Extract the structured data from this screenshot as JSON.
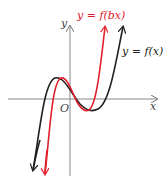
{
  "diagram": {
    "title": "",
    "axes": {
      "x_label": "x",
      "y_label": "y",
      "origin_label": "O"
    },
    "curves": [
      {
        "name": "original",
        "label": "y = f(x)",
        "color": "#231f20"
      },
      {
        "name": "stretched",
        "label": "y = f(bx)",
        "color": "#e0202c"
      }
    ],
    "colors": {
      "axis": "#888888",
      "black_curve": "#231f20",
      "red_curve": "#e0202c"
    }
  }
}
